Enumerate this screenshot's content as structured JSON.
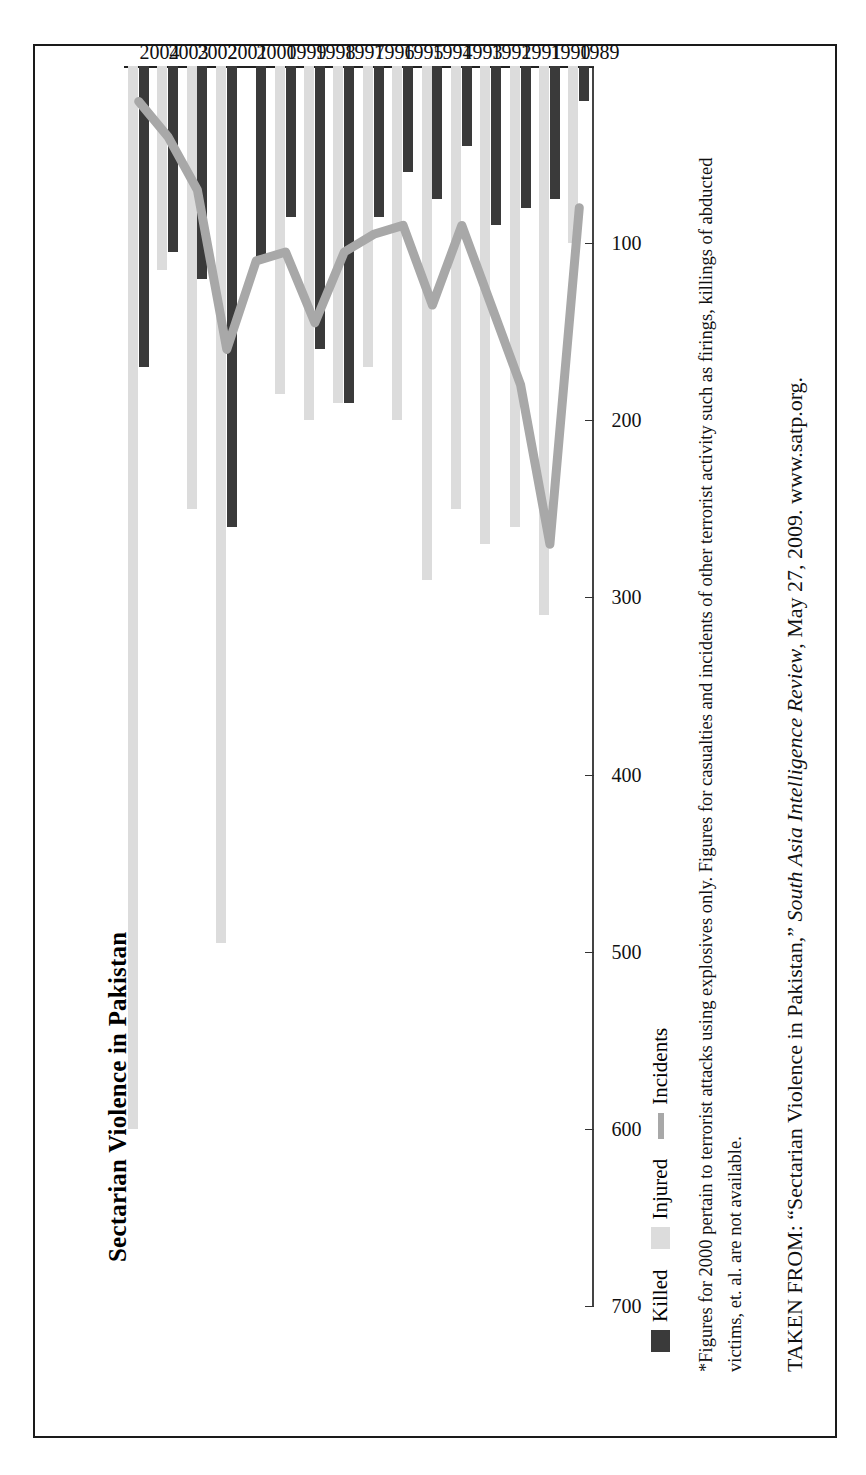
{
  "figure": {
    "title": "Sectarian Violence in Pakistan",
    "source_prefix": "TAKEN FROM: “Sectarian Violence in Pakistan,” ",
    "source_italic": "South Asia Intelligence Review",
    "source_suffix": ", May 27, 2009. www.satp.org.",
    "footnote": "*Figures for 2000 pertain to terrorist attacks using explosives only. Figures for casualties and incidents of other terrorist activity such as firings, killings of abducted victims, et. al. are not available."
  },
  "legend": {
    "items": [
      {
        "label": "Killed",
        "marker": "swatch-dark",
        "color": "#3a3a3a"
      },
      {
        "label": "Injured",
        "marker": "swatch-light",
        "color": "#dcdcdc"
      },
      {
        "label": "Incidents",
        "marker": "line",
        "color": "#a8a8a8"
      }
    ]
  },
  "chart_data": {
    "type": "bar",
    "orientation": "horizontal",
    "title": "Sectarian Violence in Pakistan",
    "xlabel": "",
    "ylabel": "",
    "categories": [
      "1989",
      "1990",
      "1991",
      "1992",
      "1993",
      "1994",
      "1995",
      "1996",
      "1997",
      "1998",
      "1999",
      "2000",
      "2001",
      "2002",
      "2003",
      "2004"
    ],
    "axis_ticks": [
      0,
      100,
      200,
      300,
      400,
      500,
      600,
      700
    ],
    "axis_tick_labels": [
      "",
      "100",
      "200",
      "300",
      "400",
      "500",
      "600",
      "700"
    ],
    "xlim": [
      0,
      700
    ],
    "grid": false,
    "legend_position": "bottom-left",
    "series": [
      {
        "name": "Killed",
        "type": "bar",
        "color": "#3a3a3a",
        "values": [
          20,
          75,
          80,
          90,
          45,
          75,
          60,
          85,
          190,
          160,
          85,
          110,
          260,
          120,
          105,
          170
        ]
      },
      {
        "name": "Injured",
        "type": "bar",
        "color": "#dcdcdc",
        "values": [
          100,
          310,
          260,
          270,
          250,
          290,
          200,
          170,
          190,
          200,
          185,
          null,
          495,
          250,
          115,
          600
        ]
      },
      {
        "name": "Incidents",
        "type": "line",
        "color": "#a8a8a8",
        "values": [
          80,
          270,
          180,
          135,
          90,
          135,
          90,
          95,
          105,
          145,
          105,
          110,
          160,
          70,
          40,
          20
        ]
      }
    ]
  }
}
